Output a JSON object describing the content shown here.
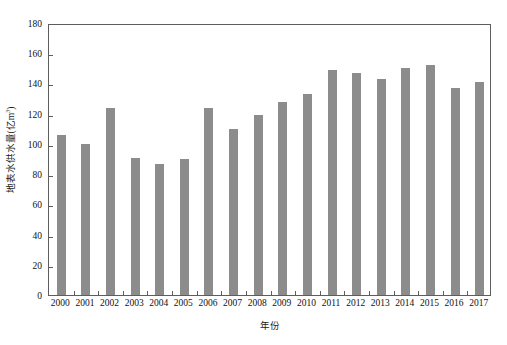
{
  "chart_data": {
    "type": "bar",
    "title": "",
    "xlabel": "年份",
    "ylabel": "地表水供水量(亿m",
    "ylabel_sup": "3",
    "ylabel_tail": ")",
    "categories": [
      "2000",
      "2001",
      "2002",
      "2003",
      "2004",
      "2005",
      "2006",
      "2007",
      "2008",
      "2009",
      "2010",
      "2011",
      "2012",
      "2013",
      "2014",
      "2015",
      "2016",
      "2017"
    ],
    "values": [
      106,
      100,
      124,
      91,
      87,
      90,
      124,
      110,
      119,
      128,
      133,
      149,
      147,
      143,
      150,
      152,
      137,
      141
    ],
    "ylim": [
      0,
      180
    ],
    "ytick_step": 20,
    "yticks": [
      "0",
      "20",
      "40",
      "60",
      "80",
      "100",
      "120",
      "140",
      "160",
      "180"
    ],
    "grid": false,
    "legend_position": "none",
    "series": [
      {
        "name": "地表水供水量",
        "values": [
          106,
          100,
          124,
          91,
          87,
          90,
          124,
          110,
          119,
          128,
          133,
          149,
          147,
          143,
          150,
          152,
          137,
          141
        ]
      }
    ],
    "bar_color": "#8c8c8c",
    "axis_color": "#5d5d5d"
  }
}
